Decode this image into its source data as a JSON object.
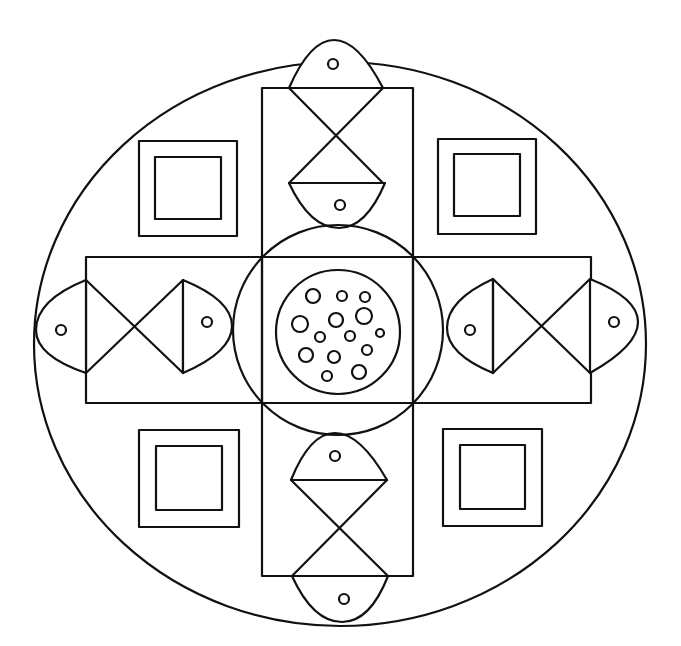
{
  "drawing": {
    "type": "mandala coloring page",
    "background": "#ffffff",
    "stroke_color": "#111111",
    "outer_circle": {
      "cx": 340,
      "cy": 342,
      "rx": 304,
      "ry": 280
    },
    "cross_vertical": {
      "x": 262,
      "y": 88,
      "w": 151,
      "h": 488
    },
    "cross_horizontal": {
      "x": 86,
      "y": 257,
      "w": 505,
      "h": 146
    },
    "center_circle": {
      "cx": 337,
      "cy": 330,
      "r": 104
    },
    "dotted_circle": {
      "cx": 336,
      "cy": 332,
      "r": 62
    },
    "corner_squares_count": 4,
    "fish_count": 8,
    "dot_count": 16
  }
}
